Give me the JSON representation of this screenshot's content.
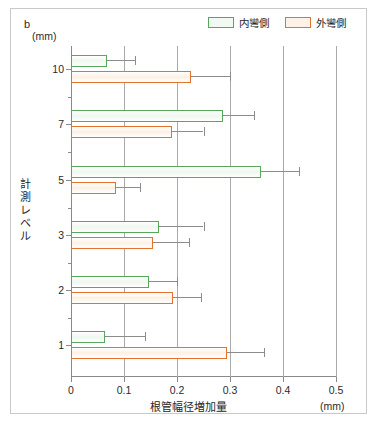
{
  "panel": {
    "letter": "b"
  },
  "legend": {
    "items": [
      {
        "label": "内彎側",
        "color": "#57a85a",
        "key": "inner"
      },
      {
        "label": "外彎側",
        "color": "#e2722c",
        "key": "outer"
      }
    ]
  },
  "axes": {
    "y_title": "計測レベル",
    "y_unit": "(mm)",
    "x_title": "根管幅径増加量",
    "x_unit": "(mm)",
    "x_ticks": [
      "0",
      "0.1",
      "0.2",
      "0.3",
      "0.4",
      "0.5"
    ],
    "y_ticks": [
      "10",
      "7",
      "5",
      "3",
      "2",
      "1"
    ]
  },
  "chart_data": {
    "type": "bar",
    "orientation": "horizontal",
    "title": "",
    "xlabel": "根管幅径増加量",
    "ylabel": "計測レベル",
    "xlim": [
      0,
      0.5
    ],
    "grid": true,
    "legend_position": "top-right",
    "categories": [
      "10",
      "7",
      "5",
      "3",
      "2",
      "1"
    ],
    "series": [
      {
        "name": "内彎側",
        "color": "#57a85a",
        "values": [
          0.068,
          0.287,
          0.358,
          0.166,
          0.147,
          0.064
        ],
        "errors_high": [
          0.12,
          0.345,
          0.43,
          0.25,
          0.2,
          0.14
        ]
      },
      {
        "name": "外彎側",
        "color": "#e2722c",
        "values": [
          0.226,
          0.19,
          0.085,
          0.155,
          0.193,
          0.294
        ],
        "errors_high": [
          0.3,
          0.25,
          0.13,
          0.222,
          0.245,
          0.365
        ]
      }
    ]
  }
}
